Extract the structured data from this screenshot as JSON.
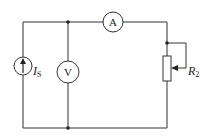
{
  "diagram": {
    "type": "circuit",
    "components": {
      "current_source": {
        "label": "I",
        "subscript": "S"
      },
      "voltmeter": {
        "label": "V"
      },
      "ammeter": {
        "label": "A"
      },
      "rheostat": {
        "label": "R",
        "subscript": "2"
      }
    },
    "colors": {
      "wire": "#333333",
      "background": "#ffffff"
    }
  }
}
